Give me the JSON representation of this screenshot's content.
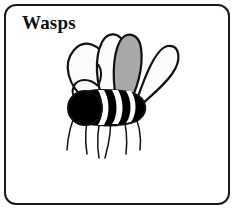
{
  "card": {
    "title": "Wasps",
    "background_color": "#ffffff",
    "border_color": "#1a1a1a",
    "corner_radius_px": 12
  },
  "illustration": {
    "name": "wasp-drawing",
    "subject": "wasp",
    "style": "black-and-white line drawing",
    "outline_color": "#111111",
    "body_color": "#000000",
    "band_color": "#ffffff",
    "wing_fill_white": "#fbfbfb",
    "wing_fill_gray": "#a8a8a8",
    "parts": [
      "left-outer-wing",
      "left-inner-wing",
      "right-inner-wing",
      "right-outer-wing",
      "head",
      "thorax",
      "abdomen",
      "antenna-loop",
      "legs"
    ],
    "wing_count": 4,
    "leg_count": 6,
    "body_band_count": 4
  }
}
